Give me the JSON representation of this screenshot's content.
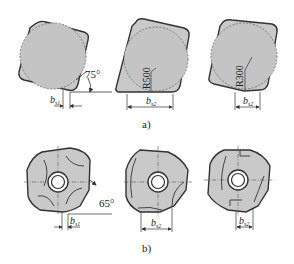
{
  "figure": {
    "part_a": {
      "caption": "a)",
      "inserts": [
        {
          "id": "a1",
          "angle_label": "75°",
          "width_label": "b",
          "width_sub": "s1"
        },
        {
          "id": "a2",
          "radius_label": "R500",
          "width_label": "b",
          "width_sub": "s2"
        },
        {
          "id": "a3",
          "radius_label": "R300",
          "width_label": "b",
          "width_sub": "s2"
        }
      ]
    },
    "part_b": {
      "caption": "b)",
      "inserts": [
        {
          "id": "b1",
          "angle_label": "65°",
          "width_label": "b",
          "width_sub": "s1"
        },
        {
          "id": "b2",
          "width_label": "b",
          "width_sub": "s2"
        },
        {
          "id": "b3",
          "width_label": "b",
          "width_sub": "s2"
        }
      ]
    },
    "colors": {
      "insert_fill": "#c9c9c9",
      "outline": "#333333",
      "dashed_circle": "#555555",
      "background": "#ffffff"
    }
  }
}
